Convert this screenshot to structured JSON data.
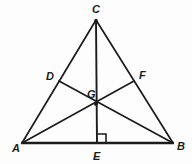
{
  "figure": {
    "background_color": "#fdfdfd",
    "stroke_color": "#1c1c1c",
    "points": {
      "A": {
        "label": "A",
        "x": 22,
        "y": 143,
        "label_x": 12,
        "label_y": 152
      },
      "B": {
        "label": "B",
        "x": 173,
        "y": 143,
        "label_x": 177,
        "label_y": 150
      },
      "C": {
        "label": "C",
        "x": 96,
        "y": 20,
        "label_x": 92,
        "label_y": 13
      },
      "D": {
        "label": "D",
        "x": 59,
        "y": 81,
        "label_x": 46,
        "label_y": 80
      },
      "E": {
        "label": "E",
        "x": 97,
        "y": 143,
        "label_x": 93,
        "label_y": 160
      },
      "F": {
        "label": "F",
        "x": 134,
        "y": 81,
        "label_x": 139,
        "label_y": 79
      },
      "G": {
        "label": "G",
        "x": 96,
        "y": 104,
        "label_x": 87,
        "label_y": 98
      }
    },
    "segments": [
      {
        "name": "side-AB",
        "from": "A",
        "to": "B",
        "width": 2.6
      },
      {
        "name": "side-AC",
        "from": "A",
        "to": "C",
        "width": 1.7
      },
      {
        "name": "side-CB",
        "from": "C",
        "to": "B",
        "width": 1.7
      },
      {
        "name": "cevian-CE",
        "from": "C",
        "to": "E",
        "width": 1.9
      },
      {
        "name": "cevian-DB",
        "from": "D",
        "to": "B",
        "width": 1.7
      },
      {
        "name": "cevian-AF",
        "from": "A",
        "to": "F",
        "width": 1.7
      }
    ],
    "right_angle": {
      "name": "right-angle-at-E",
      "vertex_x": 97,
      "vertex_y": 143,
      "size": 9,
      "direction": "up-right"
    },
    "vertex_dots": [
      "C",
      "G"
    ]
  }
}
